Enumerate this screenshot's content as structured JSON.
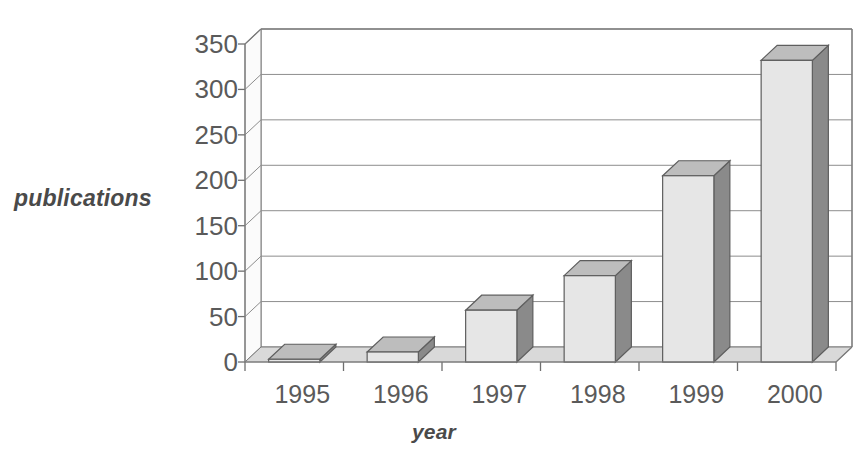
{
  "chart_data": {
    "type": "bar",
    "title": "",
    "subtitle": "",
    "categories": [
      "1995",
      "1996",
      "1997",
      "1998",
      "1999",
      "2000"
    ],
    "values": [
      3,
      11,
      57,
      95,
      205,
      332
    ],
    "xlabel": "year",
    "ylabel": "publications",
    "ylim": [
      0,
      350
    ],
    "ytick_values": [
      0,
      50,
      100,
      150,
      200,
      250,
      300,
      350
    ],
    "ytick_labels": [
      "0",
      "50",
      "100",
      "150",
      "200",
      "250",
      "300",
      "350"
    ],
    "grid": true,
    "grid_axis": "y",
    "legend": false,
    "legend_position": "none",
    "style": "3d-column",
    "series": [
      {
        "name": "publications",
        "values": [
          3,
          11,
          57,
          95,
          205,
          332
        ]
      }
    ],
    "colors": {
      "bar_front": "#e6e6e6",
      "bar_top": "#bdbdbd",
      "bar_side": "#8a8a8a",
      "floor": "#d9d9d9",
      "wall": "#ffffff",
      "gridline": "#8d8d8d",
      "text": "#5a5a5a",
      "background": "#ffffff"
    }
  }
}
